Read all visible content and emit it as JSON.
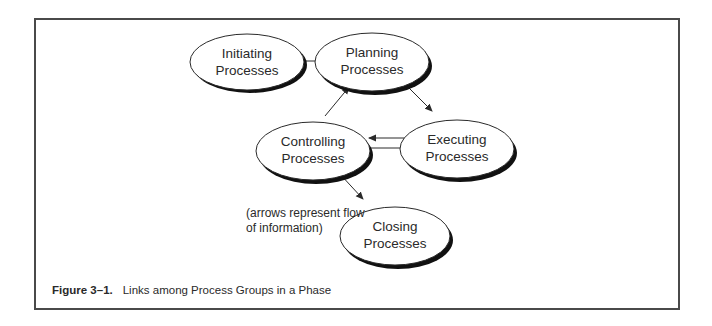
{
  "figure": {
    "caption_label": "Figure 3–1.",
    "caption_text": "Links among Process Groups in a Phase"
  },
  "nodes": [
    {
      "id": "initiating",
      "line1": "Initiating",
      "line2": "Processes"
    },
    {
      "id": "planning",
      "line1": "Planning",
      "line2": "Processes"
    },
    {
      "id": "controlling",
      "line1": "Controlling",
      "line2": "Processes"
    },
    {
      "id": "executing",
      "line1": "Executing",
      "line2": "Processes"
    },
    {
      "id": "closing",
      "line1": "Closing",
      "line2": "Processes"
    }
  ],
  "edges": [
    {
      "from": "initiating",
      "to": "planning"
    },
    {
      "from": "planning",
      "to": "executing"
    },
    {
      "from": "executing",
      "to": "controlling"
    },
    {
      "from": "controlling",
      "to": "executing"
    },
    {
      "from": "controlling",
      "to": "planning"
    },
    {
      "from": "controlling",
      "to": "closing"
    }
  ],
  "note": {
    "line1": "(arrows represent flow",
    "line2": "of information)"
  },
  "colors": {
    "stroke": "#2a2a2a",
    "shadow": "#111111",
    "frame": "#4a4a4a"
  }
}
